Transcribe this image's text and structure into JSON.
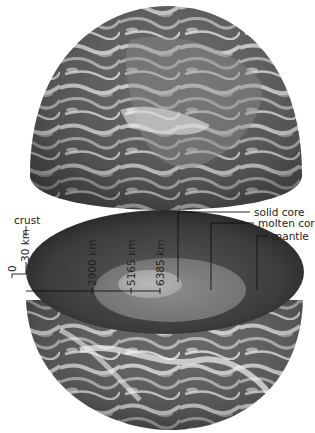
{
  "diagram": {
    "colors": {
      "background": "#ffffff",
      "mantle": "#3a3a3a",
      "molten_core": "#7a7a7a",
      "solid_core": "#a8a8a8",
      "line": "#1a1a1a",
      "text": "#222222"
    },
    "labels": {
      "crust": "crust",
      "solid_core": "solid core",
      "molten_core": "molten core",
      "mantle": "mantle"
    },
    "depths": {
      "surface": "0",
      "crust": "30 km",
      "mantle_base": "2900 km",
      "molten_core_base": "5165 km",
      "center": "6385 km"
    },
    "layers": [
      {
        "name": "crust",
        "depth_km": 30
      },
      {
        "name": "mantle",
        "depth_km": 2900
      },
      {
        "name": "molten core",
        "depth_km": 5165
      },
      {
        "name": "solid core",
        "depth_km": 6385
      }
    ]
  }
}
